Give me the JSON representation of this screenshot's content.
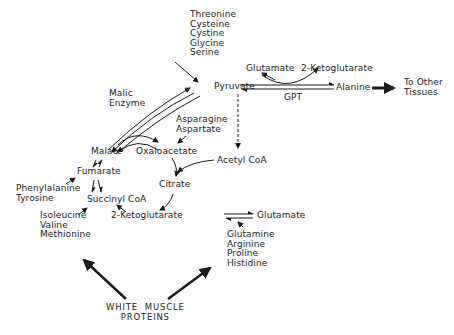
{
  "diagram": {
    "nodes": {
      "pyruvate_precursors": [
        "Threonine",
        "Cysteine",
        "Cystine",
        "Glycine",
        "Serine"
      ],
      "pyruvate": "Pyruvate",
      "glutamate_top": "Glutamate",
      "ketoglutarate_top": "2-Ketoglutarate",
      "gpt": "GPT",
      "alanine": "Alanine",
      "to_other_tissues": [
        "To Other",
        "Tissues"
      ],
      "malic_enzyme": [
        "Malic",
        "Enzyme"
      ],
      "asparagine_aspartate": [
        "Asparagine",
        "Aspartate"
      ],
      "malate": "Malate",
      "oxaloacetate": "Oxaloacetate",
      "fumarate": "Fumarate",
      "acetyl_coa": "Acetyl CoA",
      "citrate": "Citrate",
      "phe_tyr": [
        "Phenylalanine",
        "Tyrosine"
      ],
      "succinyl_coa": "Succinyl CoA",
      "ile_val_met": [
        "Isoleucine",
        "Valine",
        "Methionine"
      ],
      "ketoglutarate_bottom": "2-Ketoglutarate",
      "glutamate_bottom": "Glutamate",
      "glutamate_precursors": [
        "Glutamine",
        "Arginine",
        "Proline",
        "Histidine"
      ],
      "white_muscle_proteins": [
        "WHITE  MUSCLE",
        "PROTEINS"
      ]
    },
    "edges": [
      {
        "from": "pyruvate_precursors",
        "to": "pyruvate",
        "style": "single"
      },
      {
        "from": "pyruvate",
        "to": "alanine",
        "style": "reversible",
        "label": "GPT"
      },
      {
        "from": "glutamate_top",
        "to": "ketoglutarate_top",
        "style": "curved-coupled"
      },
      {
        "from": "alanine",
        "to": "to_other_tissues",
        "style": "bold"
      },
      {
        "from": "pyruvate",
        "to": "malate",
        "style": "reversible-curved",
        "label": "Malic Enzyme"
      },
      {
        "from": "malate",
        "to": "oxaloacetate",
        "style": "reversible-curved"
      },
      {
        "from": "asparagine_aspartate",
        "to": "oxaloacetate",
        "style": "single"
      },
      {
        "from": "pyruvate",
        "to": "acetyl_coa",
        "style": "dashed"
      },
      {
        "from": "oxaloacetate",
        "to": "citrate",
        "style": "single"
      },
      {
        "from": "acetyl_coa",
        "to": "citrate",
        "style": "single"
      },
      {
        "from": "malate",
        "to": "fumarate",
        "style": "reversible"
      },
      {
        "from": "fumarate",
        "to": "succinyl_coa",
        "style": "reversible"
      },
      {
        "from": "phe_tyr",
        "to": "fumarate",
        "style": "single"
      },
      {
        "from": "citrate",
        "to": "ketoglutarate_bottom",
        "style": "single"
      },
      {
        "from": "ketoglutarate_bottom",
        "to": "succinyl_coa",
        "style": "single"
      },
      {
        "from": "ile_val_met",
        "to": "succinyl_coa",
        "style": "single"
      },
      {
        "from": "ketoglutarate_bottom",
        "to": "glutamate_bottom",
        "style": "reversible"
      },
      {
        "from": "glutamate_precursors",
        "to": "glutamate_bottom",
        "style": "single"
      },
      {
        "from": "white_muscle_proteins",
        "to": "ile_val_met",
        "style": "bold"
      },
      {
        "from": "white_muscle_proteins",
        "to": "glutamate_precursors",
        "style": "bold"
      }
    ]
  }
}
